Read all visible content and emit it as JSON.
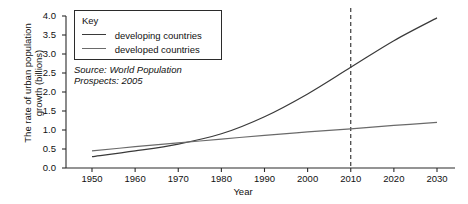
{
  "chart_data": {
    "type": "line",
    "title": "",
    "xlabel": "Year",
    "ylabel": "The rate of urban population growth (billions)",
    "ylabel_line1": "The rate of urban population",
    "ylabel_line2": "growth (billions)",
    "xlim": [
      1945,
      2033
    ],
    "ylim": [
      0.0,
      4.0
    ],
    "grid": false,
    "legend_position": "top-left",
    "legend_title": "Key",
    "xticks": [
      1950,
      1960,
      1970,
      1980,
      1990,
      2000,
      2010,
      2020,
      2030
    ],
    "xtick_labels": [
      "1950",
      "1960",
      "1970",
      "1980",
      "1990",
      "2000",
      "2010",
      "2020",
      "2030"
    ],
    "yticks": [
      0.0,
      0.5,
      1.0,
      1.5,
      2.0,
      2.5,
      3.0,
      3.5,
      4.0
    ],
    "ytick_labels": [
      "0.0",
      "0.5",
      "1.0",
      "1.5",
      "2.0",
      "2.5",
      "3.0",
      "3.5",
      "4.0"
    ],
    "x": [
      1950,
      1960,
      1970,
      1980,
      1990,
      2000,
      2010,
      2020,
      2030
    ],
    "series": [
      {
        "name": "developing countries",
        "color": "#3a3a3a",
        "values": [
          0.3,
          0.45,
          0.63,
          0.9,
          1.35,
          1.95,
          2.65,
          3.35,
          3.95
        ]
      },
      {
        "name": "developed countries",
        "color": "#6a6a6a",
        "values": [
          0.45,
          0.56,
          0.66,
          0.76,
          0.86,
          0.95,
          1.03,
          1.12,
          1.2
        ]
      }
    ],
    "annotations": [
      {
        "type": "vertical-dashed-line",
        "x": 2010,
        "label": "2010"
      }
    ],
    "source_line1": "Source: World Population",
    "source_line2": "Prospects: 2005"
  }
}
